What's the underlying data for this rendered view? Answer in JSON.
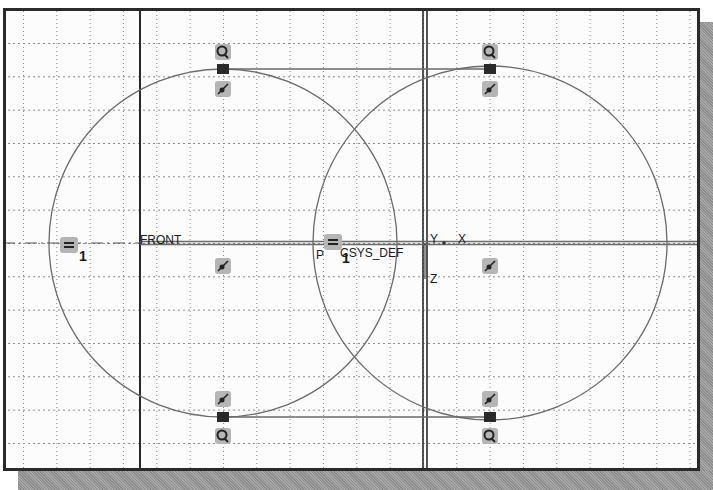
{
  "viewport": {
    "grid_spacing_px": 33.3,
    "colors": {
      "grid": "#8a8a8a",
      "frame_border": "#2a2a2a",
      "sketch_entity": "#6a6a6a",
      "datum": "#4a4a4a",
      "constraint_badge": "#b5b5b5",
      "shadow": "#9a9a9a"
    }
  },
  "labels": {
    "datum_front": "FRONT",
    "csys": "CSYS_DEF",
    "csys_prefix": "P",
    "axis_y": "Y",
    "axis_x": "X",
    "axis_z": "Z",
    "equal_left_index": "1",
    "equal_mid_index": "1"
  },
  "sketch": {
    "circles": [
      {
        "name": "left-circle",
        "cx": 220,
        "cy": 240,
        "r": 174
      },
      {
        "name": "right-circle",
        "cx": 487,
        "cy": 240,
        "r": 177
      }
    ],
    "tangent_lines": [
      {
        "name": "top-tangent-line",
        "x1": 220,
        "y1": 66,
        "x2": 487,
        "y2": 66
      },
      {
        "name": "bottom-tangent-line",
        "x1": 220,
        "y1": 414,
        "x2": 487,
        "y2": 414
      }
    ],
    "constraints": [
      {
        "type": "tangent",
        "icon": "tangent-icon",
        "x": 220,
        "y": 49
      },
      {
        "type": "tangent",
        "icon": "tangent-icon",
        "x": 487,
        "y": 49
      },
      {
        "type": "point-on-entity",
        "icon": "point-on-entity-icon",
        "x": 220,
        "y": 85
      },
      {
        "type": "point-on-entity",
        "icon": "point-on-entity-icon",
        "x": 487,
        "y": 85
      },
      {
        "type": "point-on-entity",
        "icon": "point-on-entity-icon",
        "x": 220,
        "y": 263
      },
      {
        "type": "point-on-entity",
        "icon": "point-on-entity-icon",
        "x": 487,
        "y": 263
      },
      {
        "type": "point-on-entity",
        "icon": "point-on-entity-icon",
        "x": 220,
        "y": 396
      },
      {
        "type": "point-on-entity",
        "icon": "point-on-entity-icon",
        "x": 487,
        "y": 396
      },
      {
        "type": "tangent",
        "icon": "tangent-icon",
        "x": 220,
        "y": 433
      },
      {
        "type": "tangent",
        "icon": "tangent-icon",
        "x": 487,
        "y": 433
      },
      {
        "type": "equal",
        "icon": "equal-icon",
        "x": 66,
        "y": 242
      },
      {
        "type": "equal",
        "icon": "equal-icon",
        "x": 328,
        "y": 240
      }
    ]
  }
}
